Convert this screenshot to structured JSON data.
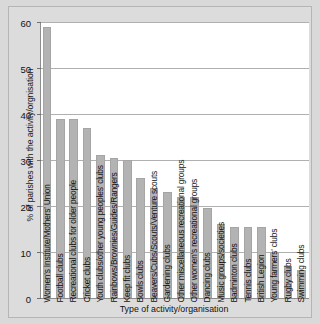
{
  "chart_data": {
    "type": "bar",
    "title": "",
    "xlabel": "Type of activity/organisation",
    "ylabel": "% of parishes with the activity/orgnisation",
    "ylim": [
      0,
      60
    ],
    "yticks": [
      0,
      10,
      20,
      30,
      40,
      50,
      60
    ],
    "grid": true,
    "legend": false,
    "bar_color": "#b3b3b3",
    "categories": [
      "Women's Institute/Mothers' Union",
      "Football clubs",
      "Recreational clubs for older people",
      "Cricket clubs",
      "Youth clubs/other young peoples' clubs",
      "Rainbows/Brownies/Guides/Rangers",
      "Keep fit clubs",
      "Bowls clubs",
      "Beavers/Cubs/Scouts/Venture scouts",
      "Gardening clubs",
      "Other miscellaneous recreational groups",
      "Other women's recreational groups",
      "Dancing clubs",
      "Music groups/societies",
      "Badminton clubs",
      "Tennis clubs",
      "British Legion",
      "Young farmers' clubs",
      "Rugby clubs",
      "Swimming clubs"
    ],
    "values": [
      59,
      39,
      39,
      37,
      31,
      30.5,
      30,
      26,
      24,
      23,
      22,
      22,
      19.5,
      16,
      15.5,
      15.5,
      15.5,
      10,
      7,
      6
    ]
  }
}
